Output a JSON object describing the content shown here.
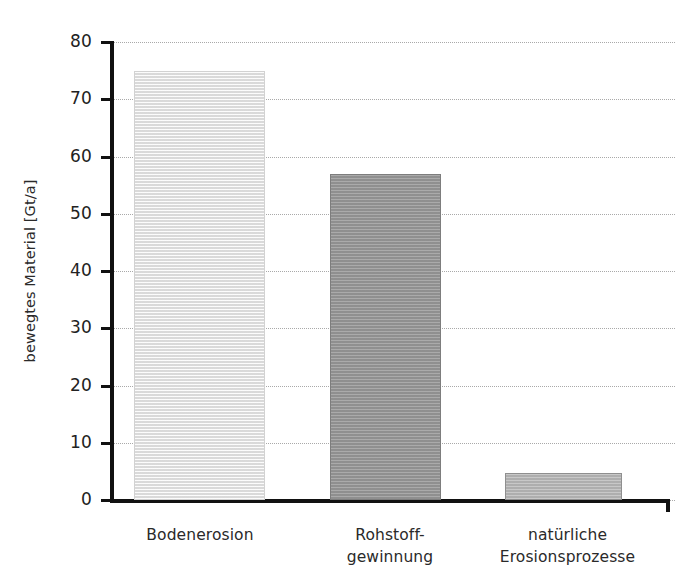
{
  "chart_data": {
    "type": "bar",
    "title": "",
    "xlabel": "",
    "ylabel": "bewegtes Material [Gt/a]",
    "ylim": [
      0,
      80
    ],
    "ytick_step": 10,
    "grid": true,
    "legend": "none",
    "categories": [
      "Bodenerosion",
      "Rohstoff-\ngewinnung",
      "natürliche\nErosionsprozesse"
    ],
    "values": [
      75,
      57,
      4.8
    ],
    "ytick_labels": [
      "0",
      "10",
      "20",
      "30",
      "40",
      "50",
      "60",
      "70",
      "80"
    ],
    "ytick_values": [
      0,
      10,
      20,
      30,
      40,
      50,
      60,
      70,
      80
    ],
    "bar_colors": [
      "#e9e9e9",
      "#9a9a9a",
      "#b9b9b9"
    ]
  },
  "axes": {
    "y_title": "bewegtes Material [Gt/a]",
    "ticks": [
      {
        "label": "80",
        "value": 80
      },
      {
        "label": "70",
        "value": 70
      },
      {
        "label": "60",
        "value": 60
      },
      {
        "label": "50",
        "value": 50
      },
      {
        "label": "40",
        "value": 40
      },
      {
        "label": "30",
        "value": 30
      },
      {
        "label": "20",
        "value": 20
      },
      {
        "label": "10",
        "value": 10
      },
      {
        "label": "0",
        "value": 0
      }
    ]
  },
  "bars": [
    {
      "name": "bar-bodenerosion",
      "value": 75,
      "label_line1": "Bodenerosion",
      "label_line2": "",
      "color": "#e9e9e9"
    },
    {
      "name": "bar-rohstoffgewinnung",
      "value": 57,
      "label_line1": "Rohstoff-",
      "label_line2": "gewinnung",
      "color": "#9a9a9a"
    },
    {
      "name": "bar-natuerliche-erosionsprozesse",
      "value": 4.8,
      "label_line1": "natürliche",
      "label_line2": "Erosionsprozesse",
      "color": "#b9b9b9"
    }
  ],
  "title_remnant": ""
}
